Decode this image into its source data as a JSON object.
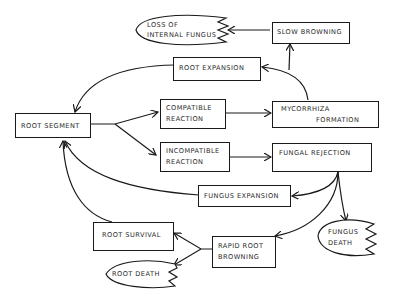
{
  "diagram": {
    "type": "flow-diagram",
    "colors": {
      "stroke": "#1a1a1a",
      "text": "#2a2a2a",
      "background": "#ffffff"
    },
    "nodes": {
      "root_segment": {
        "label": "ROOT SEGMENT",
        "shape": "rectangle"
      },
      "compatible_reaction": {
        "line1": "COMPATIBLE",
        "line2": "REACTION",
        "shape": "rectangle"
      },
      "incompatible_reaction": {
        "line1": "INCOMPATIBLE",
        "line2": "REACTION",
        "shape": "rectangle"
      },
      "mycorrhiza_formation": {
        "line1": "MYCORRHIZA",
        "line2": "FORMATION",
        "shape": "rectangle"
      },
      "fungal_rejection": {
        "label": "FUNGAL REJECTION",
        "shape": "rectangle"
      },
      "root_expansion": {
        "label": "ROOT EXPANSION",
        "shape": "rectangle"
      },
      "slow_browning": {
        "label": "SLOW BROWNING",
        "shape": "rectangle"
      },
      "loss_of_internal_fungus": {
        "line1": "LOSS OF",
        "line2": "INTERNAL FUNGUS",
        "shape": "terminal-ellipse"
      },
      "fungus_expansion": {
        "label": "FUNGUS EXPANSION",
        "shape": "rectangle"
      },
      "fungus_death": {
        "line1": "FUNGUS",
        "line2": "DEATH",
        "shape": "terminal-ellipse"
      },
      "rapid_root_browning": {
        "line1": "RAPID ROOT",
        "line2": "BROWNING",
        "shape": "rectangle"
      },
      "root_survival": {
        "label": "ROOT SURVIVAL",
        "shape": "rectangle"
      },
      "root_death": {
        "label": "ROOT DEATH",
        "shape": "terminal-ellipse"
      }
    },
    "edges": [
      {
        "from": "ROOT SEGMENT",
        "to": "COMPATIBLE REACTION"
      },
      {
        "from": "ROOT SEGMENT",
        "to": "INCOMPATIBLE REACTION"
      },
      {
        "from": "COMPATIBLE REACTION",
        "to": "MYCORRHIZA FORMATION"
      },
      {
        "from": "INCOMPATIBLE REACTION",
        "to": "FUNGAL REJECTION"
      },
      {
        "from": "MYCORRHIZA FORMATION",
        "to": "ROOT EXPANSION"
      },
      {
        "from": "MYCORRHIZA FORMATION",
        "to": "SLOW BROWNING"
      },
      {
        "from": "SLOW BROWNING",
        "to": "LOSS OF INTERNAL FUNGUS"
      },
      {
        "from": "ROOT EXPANSION",
        "to": "ROOT SEGMENT"
      },
      {
        "from": "FUNGAL REJECTION",
        "to": "FUNGUS EXPANSION"
      },
      {
        "from": "FUNGAL REJECTION",
        "to": "FUNGUS DEATH"
      },
      {
        "from": "FUNGAL REJECTION",
        "to": "RAPID ROOT BROWNING"
      },
      {
        "from": "FUNGUS EXPANSION",
        "to": "ROOT SEGMENT"
      },
      {
        "from": "RAPID ROOT BROWNING",
        "to": "ROOT SURVIVAL"
      },
      {
        "from": "RAPID ROOT BROWNING",
        "to": "ROOT DEATH"
      },
      {
        "from": "ROOT SURVIVAL",
        "to": "ROOT SEGMENT"
      }
    ]
  }
}
